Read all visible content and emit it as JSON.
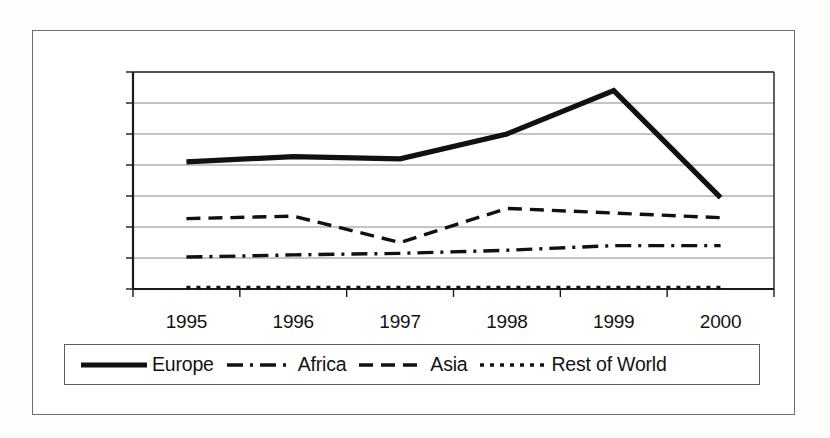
{
  "chart_data": {
    "type": "line",
    "title": "",
    "xlabel": "",
    "ylabel": "",
    "categories": [
      "1995",
      "1996",
      "1997",
      "1998",
      "1999",
      "2000"
    ],
    "ylim": [
      0,
      70000
    ],
    "ytick_values": [
      0,
      10000,
      20000,
      30000,
      40000,
      50000,
      60000,
      70000
    ],
    "ytick_labels": [
      "0",
      "10000",
      "20000",
      "30000",
      "40000",
      "50000",
      "60000",
      "70000"
    ],
    "grid": true,
    "legend_position": "bottom",
    "series": [
      {
        "name": "Europe",
        "style": "solid-thick",
        "values": [
          41000,
          42700,
          42000,
          50000,
          64000,
          29500
        ]
      },
      {
        "name": "Africa",
        "style": "dash-dot",
        "values": [
          10300,
          11000,
          11500,
          12500,
          14000,
          14000
        ]
      },
      {
        "name": "Asia",
        "style": "dashed",
        "values": [
          22700,
          23500,
          15000,
          26000,
          24500,
          23000
        ]
      },
      {
        "name": "Rest of World",
        "style": "dotted",
        "values": [
          500,
          500,
          500,
          500,
          500,
          500
        ]
      }
    ]
  },
  "legend": {
    "items": [
      {
        "label": "Europe",
        "swatch": "solid-thick-line-icon"
      },
      {
        "label": "Africa",
        "swatch": "dash-dot-line-icon"
      },
      {
        "label": "Asia",
        "swatch": "dashed-line-icon"
      },
      {
        "label": "Rest of World",
        "swatch": "dotted-line-icon"
      }
    ]
  },
  "colors": {
    "line": "#111111",
    "grid": "#8a8a8a",
    "axis": "#1a1a1a",
    "border": "#6d6d6d",
    "background": "#ffffff"
  }
}
